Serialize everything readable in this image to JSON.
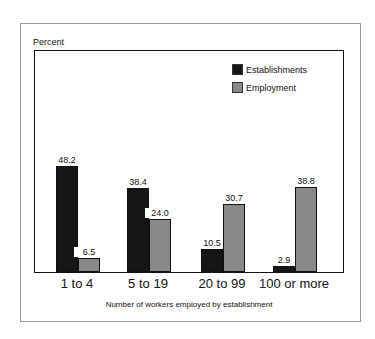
{
  "chart_data": {
    "type": "bar",
    "title": "",
    "ylabel": "Percent",
    "xlabel": "Number of workers employed by establishment",
    "categories": [
      "1 to 4",
      "5 to 19",
      "20 to 99",
      "100 or more"
    ],
    "series": [
      {
        "name": "Establishments",
        "color": "#161616",
        "values": [
          48.2,
          38.4,
          10.5,
          2.9
        ],
        "labels": [
          "48.2",
          "38.4",
          "10.5",
          "2.9"
        ]
      },
      {
        "name": "Employment",
        "color": "#888888",
        "values": [
          6.5,
          24.0,
          30.7,
          38.8
        ],
        "labels": [
          "6.5",
          "24.0",
          "30.7",
          "38.8"
        ]
      }
    ],
    "ylim": [
      0,
      100
    ],
    "grid": false,
    "legend_position": "upper right"
  }
}
